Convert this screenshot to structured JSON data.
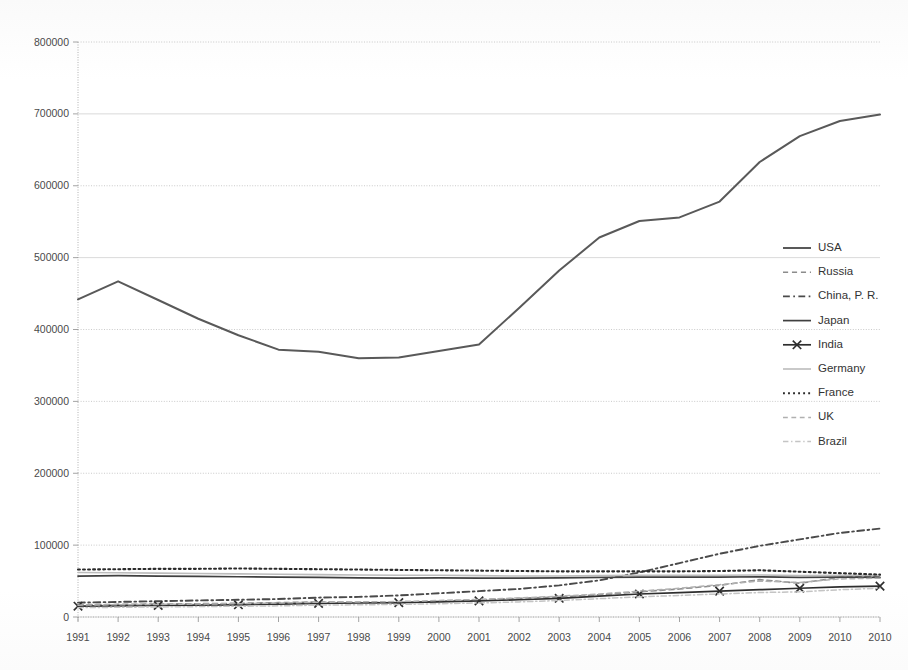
{
  "chart_data": {
    "type": "line",
    "title": "",
    "subtitle": "",
    "xlabel": "",
    "ylabel": "",
    "ylim": [
      0,
      800000
    ],
    "ytick_labels": [
      "0",
      "100000",
      "200000",
      "300000",
      "400000",
      "500000",
      "600000",
      "700000",
      "800000"
    ],
    "ytick_values": [
      0,
      100000,
      200000,
      300000,
      400000,
      500000,
      600000,
      700000,
      800000
    ],
    "grid": true,
    "legend_position": "right-middle",
    "categories": [
      "1991",
      "1992",
      "1993",
      "1994",
      "1995",
      "1996",
      "1997",
      "1998",
      "1999",
      "2000",
      "2001",
      "2002",
      "2003",
      "2004",
      "2005",
      "2006",
      "2007",
      "2008",
      "2009",
      "2010",
      "2010"
    ],
    "x": [
      1991,
      1992,
      1993,
      1994,
      1995,
      1996,
      1997,
      1998,
      1999,
      2000,
      2001,
      2002,
      2003,
      2004,
      2005,
      2006,
      2007,
      2008,
      2009,
      2010,
      2010
    ],
    "series": [
      {
        "name": "USA",
        "style": "solid",
        "color": "#595959",
        "width": 2.0,
        "marker": "none",
        "values": [
          442000,
          467000,
          441000,
          415000,
          392000,
          372000,
          369000,
          360000,
          361000,
          370000,
          379000,
          430000,
          482000,
          528000,
          551000,
          556000,
          578000,
          633000,
          669000,
          690000,
          699000
        ]
      },
      {
        "name": "Russia",
        "style": "dashed",
        "color": "#8c8c8c",
        "width": 1.6,
        "marker": "none",
        "values": [
          17000,
          17500,
          18000,
          18500,
          19000,
          20000,
          21000,
          20500,
          19500,
          22000,
          24000,
          26000,
          28000,
          31000,
          35000,
          39000,
          44000,
          52000,
          47000,
          55000,
          57000
        ]
      },
      {
        "name": "China, P. R.",
        "style": "dashdot",
        "color": "#4a4a4a",
        "width": 1.9,
        "marker": "none",
        "values": [
          20000,
          21000,
          22000,
          23000,
          24000,
          25000,
          27000,
          28000,
          30000,
          33000,
          36000,
          39000,
          44000,
          51000,
          62000,
          75000,
          88000,
          99000,
          108000,
          117000,
          123000
        ]
      },
      {
        "name": "Japan",
        "style": "solid",
        "color": "#404040",
        "width": 1.7,
        "marker": "none",
        "values": [
          57000,
          57500,
          57000,
          56500,
          56000,
          55500,
          55000,
          54500,
          54000,
          54500,
          54000,
          54000,
          54500,
          55000,
          55500,
          55500,
          55500,
          56000,
          55000,
          55500,
          55000
        ]
      },
      {
        "name": "India",
        "style": "solid-marker",
        "color": "#2e2e2e",
        "width": 1.7,
        "marker": "x",
        "values": [
          15000,
          15500,
          16000,
          16500,
          17000,
          18000,
          19000,
          19500,
          20000,
          21000,
          22500,
          24000,
          26000,
          29000,
          32000,
          34000,
          36000,
          38000,
          40000,
          42000,
          43000
        ]
      },
      {
        "name": "Germany",
        "style": "solid",
        "color": "#bcbcbc",
        "width": 1.6,
        "marker": "none",
        "values": [
          62000,
          61500,
          61000,
          60500,
          60000,
          59500,
          59000,
          58500,
          58000,
          58000,
          57500,
          57000,
          57000,
          57500,
          58000,
          58000,
          58000,
          58500,
          57500,
          58000,
          58000
        ]
      },
      {
        "name": "France",
        "style": "dotted",
        "color": "#2b2b2b",
        "width": 2.1,
        "marker": "none",
        "values": [
          66000,
          66500,
          67000,
          67000,
          67500,
          67000,
          66500,
          66000,
          65500,
          65000,
          64500,
          64000,
          63500,
          63500,
          63500,
          63500,
          64000,
          65000,
          63000,
          61000,
          59000
        ]
      },
      {
        "name": "UK",
        "style": "dashed",
        "color": "#b0b0b0",
        "width": 1.5,
        "marker": "none",
        "values": [
          16500,
          17000,
          17500,
          18000,
          18500,
          19500,
          20500,
          21000,
          21500,
          23000,
          24500,
          26500,
          29000,
          32000,
          36000,
          40000,
          45000,
          50000,
          48000,
          53000,
          54000
        ]
      },
      {
        "name": "Brazil",
        "style": "dashdot",
        "color": "#c4c4c4",
        "width": 1.5,
        "marker": "none",
        "values": [
          13000,
          13500,
          14000,
          14500,
          15000,
          15500,
          16500,
          17000,
          17500,
          18500,
          19500,
          21000,
          23000,
          25500,
          28000,
          30000,
          32000,
          34000,
          35000,
          38000,
          40000
        ]
      }
    ]
  },
  "legend": {
    "entries": [
      {
        "label": "USA"
      },
      {
        "label": "Russia"
      },
      {
        "label": "China, P. R."
      },
      {
        "label": "Japan"
      },
      {
        "label": "India"
      },
      {
        "label": "Germany"
      },
      {
        "label": "France"
      },
      {
        "label": "UK"
      },
      {
        "label": "Brazil"
      }
    ]
  },
  "axes": {
    "y_labels": [
      "800000",
      "700000",
      "600000",
      "500000",
      "400000",
      "300000",
      "200000",
      "100000",
      "0"
    ],
    "x_labels": [
      "1991",
      "1992",
      "1993",
      "1994",
      "1995",
      "1996",
      "1997",
      "1998",
      "1999",
      "2000",
      "2001",
      "2002",
      "2003",
      "2004",
      "2005",
      "2006",
      "2007",
      "2008",
      "2009",
      "2010",
      "2010"
    ]
  }
}
